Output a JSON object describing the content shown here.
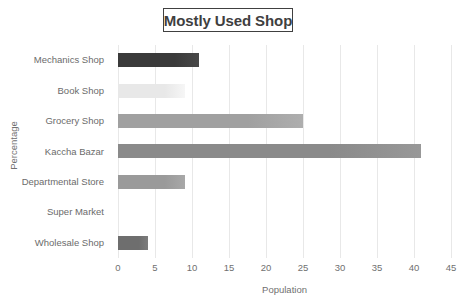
{
  "chart_data": {
    "type": "bar",
    "orientation": "horizontal",
    "title": "Mostly Used Shop",
    "xlabel": "Population",
    "ylabel": "Percentage",
    "categories": [
      "Mechanics Shop",
      "Book Shop",
      "Grocery Shop",
      "Kaccha Bazar",
      "Departmental Store",
      "Super Market",
      "Wholesale Shop"
    ],
    "values": [
      11,
      9,
      25,
      41,
      9,
      0,
      4
    ],
    "bar_colors": [
      "#3a3a3a",
      "#e8e8e8",
      "#a0a0a0",
      "#8a8a8a",
      "#9a9a9a",
      "#bfbfbf",
      "#6e6e6e"
    ],
    "xlim": [
      0,
      45
    ],
    "xticks": [
      0,
      5,
      10,
      15,
      20,
      25,
      30,
      35,
      40,
      45
    ],
    "xtick_labels": [
      "0",
      "5",
      "10",
      "15",
      "20",
      "25",
      "30",
      "35",
      "40",
      "45"
    ],
    "grid": "vertical",
    "legend": "none",
    "title_border_color": "#404040"
  }
}
